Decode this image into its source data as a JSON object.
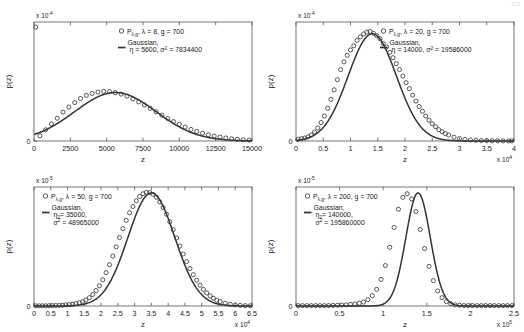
{
  "figure": {
    "background": "#ffffff",
    "marker_color": "#3a3a3a",
    "curve_color": "#333333",
    "axis_color": "#555555",
    "corner_mark": "2/3"
  },
  "chart_data": [
    {
      "type": "scatter",
      "panel": "top-left",
      "title": "",
      "xlabel": "z",
      "ylabel": "p(z)",
      "xlim": [
        0,
        15000
      ],
      "ylim": [
        0,
        0.00035
      ],
      "y_exponent": "x 10",
      "y_exponent_power": "-4",
      "x_exponent": "",
      "x_exponent_power": "",
      "xticks": [
        0,
        2500,
        5000,
        7500,
        10000,
        12500,
        15000
      ],
      "xticklabels": [
        "0",
        "2500",
        "5000",
        "7500",
        "10000",
        "12500",
        "15000"
      ],
      "yticks": [
        0,
        0.5,
        1,
        1.5,
        2,
        2.5,
        3,
        3.5
      ],
      "yticklabels": [
        "0",
        "0.5",
        "1",
        "1.5",
        "2",
        "2.5",
        "3",
        "3.5"
      ],
      "grid": false,
      "legend_position": "upper-right",
      "series": [
        {
          "name": "P_lambda,g",
          "legend_label_main": "P",
          "legend_label_sub": "λ,g",
          "legend_label_rest": ", λ = 8, g = 700",
          "style": "circles",
          "lambda": 8,
          "g": 700,
          "x": [
            400,
            800,
            1200,
            1600,
            2000,
            2400,
            2800,
            3200,
            3600,
            4000,
            4400,
            4800,
            5200,
            5600,
            6000,
            6400,
            6800,
            7200,
            7600,
            8000,
            8400,
            8800,
            9200,
            9600,
            10000,
            10400,
            10800,
            11200,
            11600,
            12000,
            12400,
            12800,
            13200,
            13600,
            14000,
            14400,
            14800
          ],
          "y": [
            0.155,
            0.33,
            0.5,
            0.67,
            0.85,
            1.0,
            1.13,
            1.25,
            1.34,
            1.4,
            1.44,
            1.46,
            1.45,
            1.42,
            1.38,
            1.32,
            1.24,
            1.15,
            1.06,
            0.96,
            0.86,
            0.76,
            0.66,
            0.57,
            0.49,
            0.41,
            0.34,
            0.28,
            0.23,
            0.185,
            0.145,
            0.115,
            0.088,
            0.066,
            0.05,
            0.036,
            0.026
          ],
          "y_scale": 0.0001,
          "outlier_point": {
            "x": 120,
            "y": 3.35,
            "note": "point at left edge near top"
          }
        },
        {
          "name": "Gaussian",
          "legend_label_main": "Gaussian,",
          "legend_label_params": "η = 5600, σ",
          "legend_label_sup": "2",
          "legend_label_tail": " = 7834400",
          "style": "line",
          "eta": 5600,
          "sigma2": 7834400
        }
      ]
    },
    {
      "type": "scatter",
      "panel": "top-right",
      "title": "",
      "xlabel": "z",
      "ylabel": "p(z)",
      "xlim": [
        0,
        40000
      ],
      "ylim": [
        0,
        0.0001
      ],
      "y_exponent": "x 10",
      "y_exponent_power": "-4",
      "x_exponent": "x 10",
      "x_exponent_power": "4",
      "xticks": [
        0,
        5000,
        10000,
        15000,
        20000,
        25000,
        30000,
        35000,
        40000
      ],
      "xticklabels": [
        "0",
        "0.5",
        "1",
        "1.5",
        "2",
        "2.5",
        "3",
        "3.5",
        "4"
      ],
      "yticks": [
        0,
        0.2,
        0.4,
        0.6,
        0.8,
        1
      ],
      "yticklabels": [
        "0",
        "0.2",
        "0.4",
        "0.6",
        "0.8",
        "1"
      ],
      "grid": false,
      "legend_position": "upper-right",
      "series": [
        {
          "name": "P_lambda,g",
          "legend_label_main": "P",
          "legend_label_sub": "λ,g",
          "legend_label_rest": ", λ = 20, g = 700",
          "style": "circles",
          "lambda": 20,
          "g": 700,
          "x": [
            400,
            1000,
            1600,
            2200,
            2800,
            3400,
            4000,
            4600,
            5200,
            5800,
            6400,
            7000,
            7600,
            8200,
            8800,
            9400,
            10000,
            10600,
            11200,
            11800,
            12400,
            13000,
            13600,
            14200,
            14800,
            15400,
            16000,
            16600,
            17200,
            17800,
            18400,
            19000,
            19600,
            20200,
            20800,
            21400,
            22000,
            22600,
            23200,
            23800,
            24400,
            25000,
            25600,
            26200,
            26800,
            27400,
            28000,
            29000,
            30000,
            31000,
            32000,
            33000,
            34000,
            35000,
            36000,
            37000,
            38000,
            39000,
            39600
          ],
          "y": [
            0.015,
            0.02,
            0.025,
            0.035,
            0.05,
            0.075,
            0.11,
            0.155,
            0.21,
            0.275,
            0.35,
            0.43,
            0.515,
            0.6,
            0.665,
            0.72,
            0.765,
            0.8,
            0.845,
            0.875,
            0.9,
            0.915,
            0.92,
            0.905,
            0.885,
            0.86,
            0.82,
            0.79,
            0.745,
            0.7,
            0.65,
            0.6,
            0.545,
            0.49,
            0.44,
            0.385,
            0.335,
            0.29,
            0.25,
            0.21,
            0.175,
            0.145,
            0.12,
            0.095,
            0.078,
            0.062,
            0.05,
            0.032,
            0.02,
            0.013,
            0.009,
            0.006,
            0.004,
            0.003,
            0.002,
            0.002,
            0.001,
            0.001,
            0.001
          ],
          "y_scale": 0.0001
        },
        {
          "name": "Gaussian",
          "legend_label_main": "Gaussian,",
          "legend_label_params": "η = 14000, σ",
          "legend_label_sup": "2",
          "legend_label_tail": " = 19586000",
          "style": "line",
          "eta": 14000,
          "sigma2": 19586000
        }
      ]
    },
    {
      "type": "scatter",
      "panel": "bottom-left",
      "title": "",
      "xlabel": "z",
      "ylabel": "p(z)",
      "xlim": [
        0,
        65000
      ],
      "ylim": [
        0,
        6e-05
      ],
      "y_exponent": "x 10",
      "y_exponent_power": "-5",
      "x_exponent": "x 10",
      "x_exponent_power": "4",
      "xticks": [
        0,
        5000,
        10000,
        15000,
        20000,
        25000,
        30000,
        35000,
        40000,
        45000,
        50000,
        55000,
        60000,
        65000
      ],
      "xticklabels": [
        "0",
        "0.5",
        "1",
        "1.5",
        "2",
        "2.5",
        "3",
        "3.5",
        "4",
        "4.5",
        "5",
        "5.5",
        "6",
        "6.5"
      ],
      "yticks": [
        0,
        1,
        2,
        3,
        4,
        5,
        6
      ],
      "yticklabels": [
        "0",
        "1",
        "2",
        "3",
        "4",
        "5",
        "6"
      ],
      "grid": false,
      "legend_position": "upper-left",
      "series": [
        {
          "name": "P_lambda,g",
          "legend_label_main": "P",
          "legend_label_sub": "λ,g",
          "legend_label_rest": ", λ = 50, g = 700",
          "style": "circles",
          "lambda": 50,
          "g": 700,
          "x": [
            500,
            1500,
            2500,
            3500,
            4500,
            5500,
            6500,
            7500,
            8500,
            9500,
            10500,
            11500,
            12500,
            13500,
            14500,
            15500,
            16500,
            17500,
            18500,
            19500,
            20500,
            21500,
            22500,
            23500,
            24500,
            25500,
            26500,
            27500,
            28500,
            29500,
            30500,
            31500,
            32500,
            33500,
            34500,
            35500,
            36500,
            37500,
            38500,
            39500,
            40500,
            41500,
            42500,
            43500,
            44500,
            45500,
            46500,
            47500,
            48500,
            49500,
            50500,
            51500,
            52500,
            53500,
            54500,
            55500,
            57000,
            58500,
            60000,
            61500,
            63000,
            64500
          ],
          "y": [
            0.01,
            0.01,
            0.01,
            0.012,
            0.015,
            0.02,
            0.025,
            0.03,
            0.04,
            0.055,
            0.07,
            0.09,
            0.12,
            0.16,
            0.22,
            0.3,
            0.42,
            0.58,
            0.78,
            1.02,
            1.32,
            1.68,
            2.08,
            2.52,
            2.98,
            3.45,
            3.9,
            4.32,
            4.7,
            5.02,
            5.3,
            5.52,
            5.66,
            5.73,
            5.72,
            5.63,
            5.48,
            5.25,
            4.97,
            4.63,
            4.25,
            3.85,
            3.43,
            3.02,
            2.62,
            2.24,
            1.89,
            1.58,
            1.3,
            1.05,
            0.84,
            0.66,
            0.51,
            0.39,
            0.29,
            0.22,
            0.14,
            0.09,
            0.055,
            0.035,
            0.02,
            0.012
          ],
          "y_scale": 1e-05
        },
        {
          "name": "Gaussian",
          "legend_label_main": "Gaussian,",
          "legend_label_params_main": "η",
          "legend_label_params_sub": "2",
          "legend_label_params_rest": "= 35000,",
          "legend_label_sigma": "σ",
          "legend_label_sup": "2",
          "legend_label_tail": " = 48965000",
          "style": "line",
          "eta": 35000,
          "sigma2": 48965000
        }
      ]
    },
    {
      "type": "scatter",
      "panel": "bottom-right",
      "title": "",
      "xlabel": "z",
      "ylabel": "p(z)",
      "xlim": [
        0,
        250000
      ],
      "ylim": [
        0,
        3e-05
      ],
      "y_exponent": "x 10",
      "y_exponent_power": "-5",
      "x_exponent": "x 10",
      "x_exponent_power": "5",
      "xticks": [
        0,
        50000,
        100000,
        150000,
        200000,
        250000
      ],
      "xticklabels": [
        "0",
        "0.5",
        "1",
        "1.5",
        "2",
        "2.5"
      ],
      "yticks": [
        0,
        0.5,
        1,
        1.5,
        2,
        2.5,
        3
      ],
      "yticklabels": [
        "0",
        "0.5",
        "1",
        "1.5",
        "2",
        "2.5",
        "3"
      ],
      "grid": false,
      "legend_position": "upper-left",
      "series": [
        {
          "name": "P_lambda,g",
          "legend_label_main": "P",
          "legend_label_sub": "λ,g",
          "legend_label_rest": ", λ = 200, g = 700",
          "style": "circles",
          "lambda": 200,
          "g": 700,
          "x": [
            2500,
            7500,
            12500,
            17500,
            22500,
            27500,
            32500,
            37500,
            42500,
            47500,
            52500,
            57500,
            62500,
            67500,
            72500,
            77500,
            82500,
            87500,
            92500,
            97500,
            102500,
            107500,
            112500,
            117500,
            122500,
            127500,
            132500,
            137500,
            142500,
            147500,
            152500,
            157500,
            162500,
            167500,
            172500,
            177500,
            182500,
            187500,
            192500,
            197500,
            202500,
            207500,
            212500,
            217500,
            222500,
            227500,
            232500,
            237500,
            242500,
            247500
          ],
          "y": [
            0.01,
            0.01,
            0.01,
            0.01,
            0.01,
            0.01,
            0.01,
            0.012,
            0.015,
            0.02,
            0.025,
            0.03,
            0.04,
            0.05,
            0.07,
            0.1,
            0.16,
            0.26,
            0.42,
            0.67,
            1.02,
            1.48,
            1.98,
            2.44,
            2.74,
            2.83,
            2.7,
            2.38,
            1.93,
            1.45,
            1.0,
            0.64,
            0.38,
            0.21,
            0.11,
            0.06,
            0.03,
            0.02,
            0.012,
            0.01,
            0.01,
            0.01,
            0.01,
            0.01,
            0.01,
            0.01,
            0.01,
            0.01,
            0.01,
            0.01
          ],
          "y_scale": 1e-05
        },
        {
          "name": "Gaussian",
          "legend_label_main": "Gaussian,",
          "legend_label_params_main": "η",
          "legend_label_params_sub": "2",
          "legend_label_params_rest": "= 140000,",
          "legend_label_sigma": "σ",
          "legend_label_sup": "2",
          "legend_label_tail": " = 195860000",
          "style": "line",
          "eta": 140000,
          "sigma2": 195860000
        }
      ]
    }
  ]
}
